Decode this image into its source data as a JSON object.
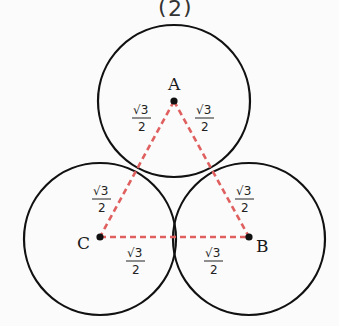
{
  "top_fragment": {
    "left_paren": "(",
    "value": "2",
    "right_paren": ")"
  },
  "points": {
    "A": {
      "label": "A",
      "cx": 174,
      "cy": 101
    },
    "B": {
      "label": "B",
      "cx": 249,
      "cy": 237
    },
    "C": {
      "label": "C",
      "cx": 100,
      "cy": 237
    }
  },
  "circles": [
    {
      "center": "A",
      "r": 76
    },
    {
      "center": "B",
      "r": 76
    },
    {
      "center": "C",
      "r": 76
    }
  ],
  "segment_labels": {
    "numerator": "√3",
    "denominator": "2",
    "items": [
      {
        "id": "A-left",
        "x": 141,
        "y": 118
      },
      {
        "id": "A-right",
        "x": 205,
        "y": 118
      },
      {
        "id": "C-upper",
        "x": 102,
        "y": 188
      },
      {
        "id": "B-upper",
        "x": 245,
        "y": 188
      },
      {
        "id": "C-lower",
        "x": 135,
        "y": 258
      },
      {
        "id": "B-lower",
        "x": 214,
        "y": 258
      }
    ]
  },
  "colors": {
    "circle_stroke": "#111111",
    "dashed_line": "#e06060",
    "point": "#111111"
  }
}
